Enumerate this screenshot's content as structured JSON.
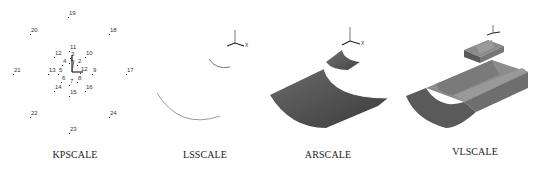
{
  "figure": {
    "panels": [
      {
        "id": "kpscale",
        "caption": "KPSCALE",
        "description": "keypoints scaled about origin",
        "keypoints": [
          {
            "label": "19",
            "x": 69,
            "y": 10
          },
          {
            "label": "20",
            "x": 31,
            "y": 27
          },
          {
            "label": "18",
            "x": 110,
            "y": 27
          },
          {
            "label": "11",
            "x": 70,
            "y": 44
          },
          {
            "label": "12",
            "x": 55,
            "y": 50
          },
          {
            "label": "10",
            "x": 86,
            "y": 50
          },
          {
            "label": "3",
            "x": 71,
            "y": 51
          },
          {
            "label": "1",
            "x": 70,
            "y": 56
          },
          {
            "label": "4",
            "x": 63,
            "y": 58
          },
          {
            "label": "2",
            "x": 78,
            "y": 58
          },
          {
            "label": "21",
            "x": 14,
            "y": 67
          },
          {
            "label": "13",
            "x": 49,
            "y": 67
          },
          {
            "label": "5",
            "x": 59,
            "y": 67
          },
          {
            "label": "12",
            "x": 81,
            "y": 66
          },
          {
            "label": "9",
            "x": 93,
            "y": 67
          },
          {
            "label": "17",
            "x": 127,
            "y": 67
          },
          {
            "label": "6",
            "x": 62,
            "y": 75
          },
          {
            "label": "7",
            "x": 70,
            "y": 78
          },
          {
            "label": "8",
            "x": 78,
            "y": 75
          },
          {
            "label": "14",
            "x": 55,
            "y": 84
          },
          {
            "label": "16",
            "x": 86,
            "y": 84
          },
          {
            "label": "15",
            "x": 70,
            "y": 89
          },
          {
            "label": "22",
            "x": 31,
            "y": 110
          },
          {
            "label": "24",
            "x": 110,
            "y": 110
          },
          {
            "label": "23",
            "x": 70,
            "y": 126
          }
        ]
      },
      {
        "id": "lsscale",
        "caption": "LSSCALE",
        "description": "two arc lines, small and scaled"
      },
      {
        "id": "arscale",
        "caption": "ARSCALE",
        "description": "two curved surface areas, small and scaled"
      },
      {
        "id": "vlscale",
        "caption": "VLSCALE",
        "description": "two solid volumes, small and scaled"
      }
    ],
    "axis_triad": {
      "x_label": "X"
    },
    "colors": {
      "surface_dark": "#4a4a4a",
      "surface_mid": "#6e6e6e",
      "surface_light": "#9a9a9a",
      "line": "#8a8a8a",
      "text": "#222222"
    }
  }
}
